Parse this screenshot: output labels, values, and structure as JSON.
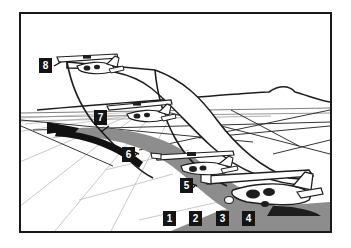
{
  "figure": {
    "frame": {
      "border_color": "#1a1a1a",
      "background_color": "#ffffff",
      "x": 19,
      "y": 12,
      "width": 313,
      "height": 221
    },
    "colors": {
      "ink": "#141414",
      "line": "#1e1e1e",
      "shadow_gray": "#8d8d8d",
      "pavement_line": "#c9c9c9",
      "label_background": "#141414",
      "label_text": "#ffffff",
      "paper": "#ffffff"
    }
  },
  "callouts": [
    {
      "id": "callout-1",
      "label": "1",
      "x": 161,
      "y": 209
    },
    {
      "id": "callout-2",
      "label": "2",
      "x": 187,
      "y": 209
    },
    {
      "id": "callout-3",
      "label": "3",
      "x": 214,
      "y": 209
    },
    {
      "id": "callout-4",
      "label": "4",
      "x": 240,
      "y": 209
    },
    {
      "id": "callout-5",
      "label": "5",
      "x": 178,
      "y": 176
    },
    {
      "id": "callout-6",
      "label": "6",
      "x": 120,
      "y": 145
    },
    {
      "id": "callout-7",
      "label": "7",
      "x": 92,
      "y": 108
    },
    {
      "id": "callout-8",
      "label": "8",
      "x": 37,
      "y": 56
    }
  ],
  "scene": {
    "elements": [
      {
        "name": "horizon-ridge",
        "kind": "outline",
        "notes": "distant hills across upper middle"
      },
      {
        "name": "runway-surface",
        "kind": "perspective-lines",
        "notes": "light gray pavement joint lines receding to the left"
      },
      {
        "name": "vortex-shadow",
        "kind": "filled-gray",
        "notes": "gray swath running diagonally from lower right to upper left"
      },
      {
        "name": "wake-vortex-band",
        "kind": "outline",
        "notes": "large tapering ribbon sweeping from lower right up to the left"
      },
      {
        "name": "vortex-arrow",
        "kind": "filled-black",
        "notes": "solid black arrow head at upper-left end of the swath"
      },
      {
        "name": "lead-aircraft",
        "kind": "aircraft",
        "notes": "large airliner on the runway at lower right"
      },
      {
        "name": "trailing-aircraft-near",
        "kind": "aircraft",
        "notes": "small aircraft near callout 6"
      },
      {
        "name": "trailing-aircraft-mid",
        "kind": "aircraft",
        "notes": "small aircraft near callout 7"
      },
      {
        "name": "trailing-aircraft-far",
        "kind": "aircraft",
        "notes": "small aircraft near callout 8"
      }
    ]
  }
}
